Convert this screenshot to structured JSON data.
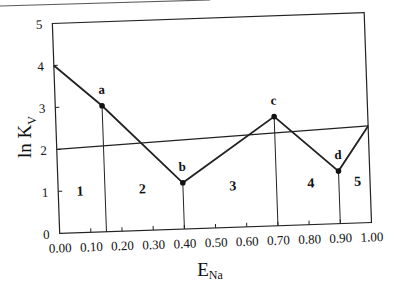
{
  "chart_data": {
    "type": "line",
    "title": "",
    "xlabel": "E",
    "xlabel_sub": "Na",
    "ylabel": "ln K",
    "ylabel_sub": "V",
    "xlim": [
      0,
      1
    ],
    "ylim": [
      0,
      5
    ],
    "grid": false,
    "legend": null,
    "x_ticks": [
      "0.00",
      "0.10",
      "0.20",
      "0.30",
      "0.40",
      "0.50",
      "0.60",
      "0.70",
      "0.80",
      "0.90",
      "1.00"
    ],
    "y_ticks": [
      "0",
      "1",
      "2",
      "3",
      "4",
      "5"
    ],
    "series": [
      {
        "name": "ln Kv polyline",
        "x": [
          0.0,
          0.15,
          0.4,
          0.7,
          0.9,
          1.0
        ],
        "y": [
          4.0,
          3.0,
          1.1,
          2.6,
          1.25,
          2.3
        ]
      },
      {
        "name": "reference line",
        "x": [
          0.0,
          1.0
        ],
        "y": [
          2.0,
          2.3
        ]
      }
    ],
    "points": [
      {
        "label": "a",
        "x": 0.15,
        "y": 3.0
      },
      {
        "label": "b",
        "x": 0.4,
        "y": 1.1
      },
      {
        "label": "c",
        "x": 0.7,
        "y": 2.6
      },
      {
        "label": "d",
        "x": 0.9,
        "y": 1.25
      }
    ],
    "vertical_dividers": [
      0.15,
      0.4,
      0.7,
      0.9
    ],
    "regions": [
      {
        "label": "1",
        "x": 0.07,
        "y": 1.0
      },
      {
        "label": "2",
        "x": 0.27,
        "y": 1.0
      },
      {
        "label": "3",
        "x": 0.56,
        "y": 1.0
      },
      {
        "label": "4",
        "x": 0.81,
        "y": 1.0
      },
      {
        "label": "5",
        "x": 0.96,
        "y": 1.0
      }
    ]
  }
}
